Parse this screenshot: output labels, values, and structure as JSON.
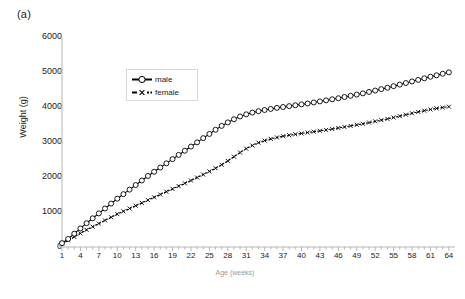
{
  "panel": {
    "label": "(a)"
  },
  "legend": {
    "items": [
      {
        "label": "male",
        "marker": "open-circle",
        "line": "solid",
        "color": "#000000"
      },
      {
        "label": "female",
        "marker": "cross-x",
        "line": "dashed",
        "color": "#000000"
      }
    ]
  },
  "chart_data": {
    "type": "line",
    "title": "",
    "subtitle": "",
    "xlabel": "Age (weeks)",
    "ylabel": "Weight (g)",
    "xlim": [
      1,
      65
    ],
    "ylim": [
      0,
      6000
    ],
    "yticks": [
      0,
      1000,
      2000,
      3000,
      4000,
      5000,
      6000
    ],
    "xticks": [
      1,
      4,
      7,
      10,
      13,
      16,
      19,
      22,
      25,
      28,
      31,
      34,
      37,
      40,
      43,
      46,
      49,
      52,
      55,
      58,
      61,
      64
    ],
    "x_minor_tick_step": 1,
    "grid": false,
    "legend_position": "upper-left-inside",
    "x": [
      1,
      2,
      3,
      4,
      5,
      6,
      7,
      8,
      9,
      10,
      11,
      12,
      13,
      14,
      15,
      16,
      17,
      18,
      19,
      20,
      21,
      22,
      23,
      24,
      25,
      26,
      27,
      28,
      29,
      30,
      31,
      32,
      33,
      34,
      35,
      36,
      37,
      38,
      39,
      40,
      41,
      42,
      43,
      44,
      45,
      46,
      47,
      48,
      49,
      50,
      51,
      52,
      53,
      54,
      55,
      56,
      57,
      58,
      59,
      60,
      61,
      62,
      63,
      64
    ],
    "series": [
      {
        "name": "male",
        "marker": "open-circle",
        "line": "solid",
        "values": [
          110,
          230,
          380,
          530,
          680,
          820,
          960,
          1100,
          1240,
          1380,
          1510,
          1640,
          1770,
          1900,
          2030,
          2150,
          2270,
          2390,
          2510,
          2630,
          2750,
          2870,
          2990,
          3110,
          3230,
          3350,
          3460,
          3560,
          3650,
          3730,
          3790,
          3840,
          3880,
          3915,
          3945,
          3975,
          4000,
          4025,
          4050,
          4075,
          4100,
          4130,
          4160,
          4190,
          4220,
          4250,
          4285,
          4320,
          4355,
          4390,
          4430,
          4470,
          4510,
          4550,
          4595,
          4640,
          4685,
          4730,
          4775,
          4820,
          4865,
          4905,
          4950,
          4990
        ]
      },
      {
        "name": "female",
        "marker": "cross-x",
        "line": "dashed",
        "values": [
          100,
          190,
          290,
          390,
          490,
          580,
          670,
          760,
          850,
          940,
          1020,
          1100,
          1180,
          1260,
          1340,
          1420,
          1500,
          1580,
          1660,
          1740,
          1820,
          1900,
          1985,
          2070,
          2160,
          2250,
          2350,
          2460,
          2580,
          2700,
          2810,
          2900,
          2980,
          3040,
          3090,
          3130,
          3165,
          3195,
          3220,
          3245,
          3270,
          3295,
          3320,
          3345,
          3370,
          3400,
          3430,
          3460,
          3490,
          3520,
          3555,
          3590,
          3625,
          3660,
          3700,
          3740,
          3780,
          3820,
          3860,
          3895,
          3930,
          3960,
          3985,
          4010
        ]
      }
    ]
  }
}
